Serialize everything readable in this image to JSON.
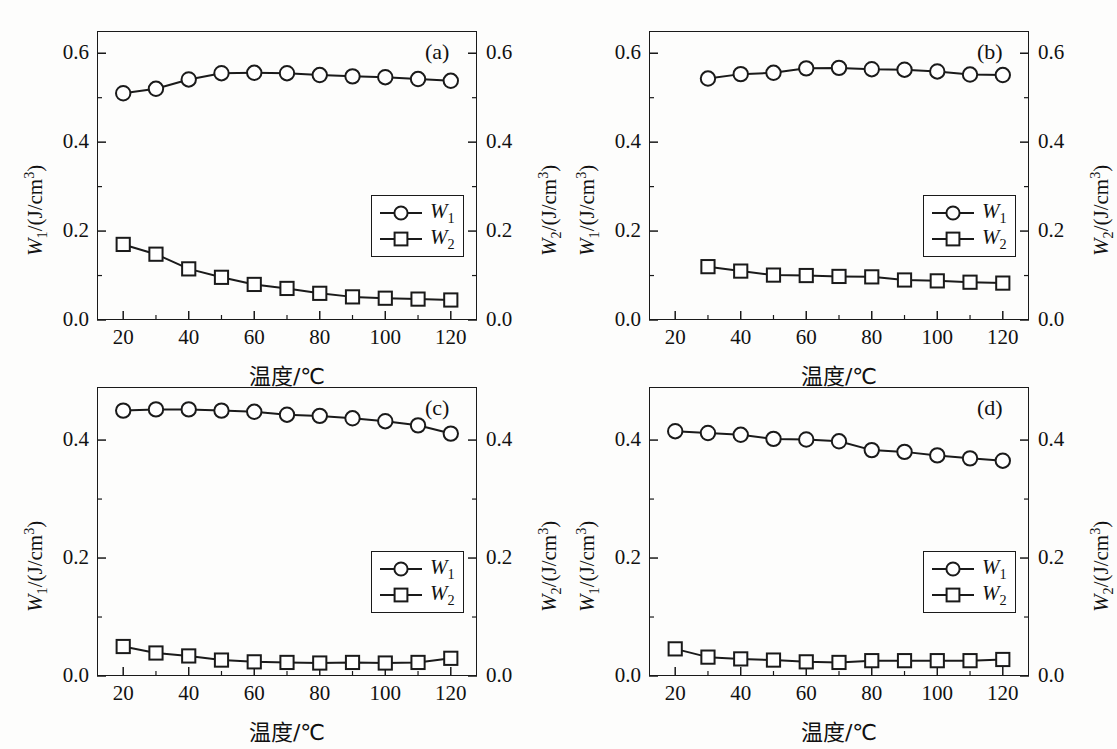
{
  "figure": {
    "background": "#fdfdfc",
    "line_color": "#1a1a1a",
    "marker_fill": "#ffffff"
  },
  "axis": {
    "xlabel": "温度/℃",
    "ylabel_left_prefix": "W",
    "ylabel_left_sub": "1",
    "ylabel_left_unit": "/(J/cm",
    "ylabel_left_sup": "3",
    "ylabel_left_close": ")",
    "ylabel_right_prefix": "W",
    "ylabel_right_sub": "2",
    "ylabel_right_unit": "/(J/cm",
    "ylabel_right_sup": "3",
    "ylabel_right_close": ")",
    "xticks": [
      20,
      40,
      60,
      80,
      100,
      120
    ],
    "xticklabels": [
      "20",
      "40",
      "60",
      "80",
      "100",
      "120"
    ],
    "xminor_step": 10,
    "xlim": [
      12,
      128
    ]
  },
  "legend": {
    "entries": [
      {
        "label_base": "W",
        "label_sub": "1",
        "marker": "circle"
      },
      {
        "label_base": "W",
        "label_sub": "2",
        "marker": "square"
      }
    ]
  },
  "chart_data": [
    {
      "type": "line",
      "panel": "(a)",
      "title": "",
      "xlabel": "温度/℃",
      "ylabel": "W1/(J/cm3)",
      "ylabel_right": "W2/(J/cm3)",
      "xlim": [
        12,
        128
      ],
      "ylim": [
        0.0,
        0.65
      ],
      "yticks": [
        0.0,
        0.2,
        0.4,
        0.6
      ],
      "yticklabels": [
        "0.0",
        "0.2",
        "0.4",
        "0.6"
      ],
      "yminor": [
        0.1,
        0.3,
        0.5
      ],
      "grid": false,
      "legend_position": "lower-right",
      "x": [
        20,
        30,
        40,
        50,
        60,
        70,
        80,
        90,
        100,
        110,
        120
      ],
      "series": [
        {
          "name": "W1",
          "marker": "circle",
          "values": [
            0.51,
            0.52,
            0.541,
            0.555,
            0.556,
            0.555,
            0.551,
            0.548,
            0.546,
            0.542,
            0.538
          ]
        },
        {
          "name": "W2",
          "marker": "square",
          "values": [
            0.17,
            0.148,
            0.115,
            0.096,
            0.08,
            0.071,
            0.06,
            0.052,
            0.049,
            0.047,
            0.045
          ]
        }
      ]
    },
    {
      "type": "line",
      "panel": "(b)",
      "title": "",
      "xlabel": "温度/℃",
      "ylabel": "W1/(J/cm3)",
      "ylabel_right": "W2/(J/cm3)",
      "xlim": [
        12,
        128
      ],
      "ylim": [
        0.0,
        0.65
      ],
      "yticks": [
        0.0,
        0.2,
        0.4,
        0.6
      ],
      "yticklabels": [
        "0.0",
        "0.2",
        "0.4",
        "0.6"
      ],
      "yminor": [
        0.1,
        0.3,
        0.5
      ],
      "grid": false,
      "legend_position": "lower-right",
      "x": [
        30,
        40,
        50,
        60,
        70,
        80,
        90,
        100,
        110,
        120
      ],
      "series": [
        {
          "name": "W1",
          "marker": "circle",
          "values": [
            0.543,
            0.553,
            0.556,
            0.566,
            0.567,
            0.564,
            0.563,
            0.559,
            0.552,
            0.551
          ]
        },
        {
          "name": "W2",
          "marker": "square",
          "values": [
            0.12,
            0.11,
            0.101,
            0.1,
            0.098,
            0.097,
            0.09,
            0.088,
            0.085,
            0.083
          ]
        }
      ]
    },
    {
      "type": "line",
      "panel": "(c)",
      "title": "",
      "xlabel": "温度/℃",
      "ylabel": "W1/(J/cm3)",
      "ylabel_right": "W2/(J/cm3)",
      "xlim": [
        12,
        128
      ],
      "ylim": [
        0.0,
        0.49
      ],
      "yticks": [
        0.0,
        0.2,
        0.4
      ],
      "yticklabels": [
        "0.0",
        "0.2",
        "0.4"
      ],
      "yminor": [
        0.1,
        0.3
      ],
      "grid": false,
      "legend_position": "lower-right",
      "x": [
        20,
        30,
        40,
        50,
        60,
        70,
        80,
        90,
        100,
        110,
        120
      ],
      "series": [
        {
          "name": "W1",
          "marker": "circle",
          "values": [
            0.45,
            0.452,
            0.452,
            0.45,
            0.448,
            0.443,
            0.441,
            0.437,
            0.432,
            0.425,
            0.411
          ]
        },
        {
          "name": "W2",
          "marker": "square",
          "values": [
            0.05,
            0.039,
            0.034,
            0.027,
            0.024,
            0.023,
            0.022,
            0.023,
            0.022,
            0.023,
            0.03
          ]
        }
      ]
    },
    {
      "type": "line",
      "panel": "(d)",
      "title": "",
      "xlabel": "温度/℃",
      "ylabel": "W1/(J/cm3)",
      "ylabel_right": "W2/(J/cm3)",
      "xlim": [
        12,
        128
      ],
      "ylim": [
        0.0,
        0.49
      ],
      "yticks": [
        0.0,
        0.2,
        0.4
      ],
      "yticklabels": [
        "0.0",
        "0.2",
        "0.4"
      ],
      "yminor": [
        0.1,
        0.3
      ],
      "grid": false,
      "legend_position": "lower-right",
      "x": [
        20,
        30,
        40,
        50,
        60,
        70,
        80,
        90,
        100,
        110,
        120
      ],
      "series": [
        {
          "name": "W1",
          "marker": "circle",
          "values": [
            0.415,
            0.412,
            0.409,
            0.402,
            0.401,
            0.398,
            0.383,
            0.38,
            0.374,
            0.369,
            0.365
          ]
        },
        {
          "name": "W2",
          "marker": "square",
          "values": [
            0.046,
            0.032,
            0.029,
            0.027,
            0.024,
            0.023,
            0.026,
            0.026,
            0.026,
            0.026,
            0.028
          ]
        }
      ]
    }
  ]
}
